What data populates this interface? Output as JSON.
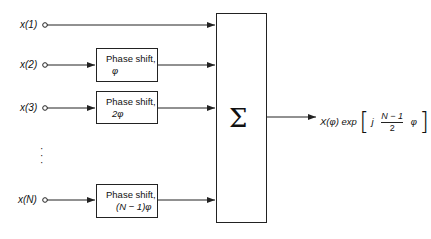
{
  "diagram": {
    "inputs": [
      {
        "label": "x(1)"
      },
      {
        "label": "x(2)"
      },
      {
        "label": "x(3)"
      },
      {
        "label": "x(N)"
      }
    ],
    "ellipsis": "⋮",
    "phase_blocks": [
      {
        "line1": "Phase shift,",
        "line2": "φ"
      },
      {
        "line1": "Phase shift,",
        "line2": "2φ"
      },
      {
        "line1": "Phase shift,",
        "line2": "(N − 1)φ"
      }
    ],
    "summer": {
      "symbol": "Σ"
    },
    "output": {
      "prefix": "X(φ) exp",
      "j": "j",
      "numerator": "N − 1",
      "denominator": "2",
      "phi": "φ"
    }
  }
}
